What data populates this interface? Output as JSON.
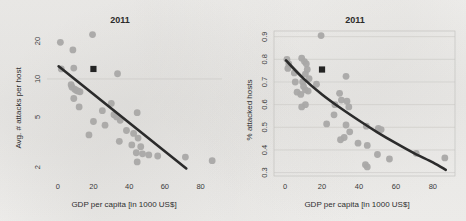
{
  "figure": {
    "panels": [
      {
        "id": "left",
        "title": "2011",
        "xlabel": "GDP per capita [in 1000 US$]",
        "ylabel": "Avg. # attacks per host"
      },
      {
        "id": "right",
        "title": "2011",
        "xlabel": "GDP per capita [in 1000 US$]",
        "ylabel": "% attacked hosts"
      }
    ]
  },
  "chart_data": [
    {
      "type": "scatter",
      "panel": "left",
      "title": "2011",
      "xlabel": "GDP per capita [in 1000 US$]",
      "ylabel": "Avg. # attacks per host",
      "xlim": [
        -6,
        92
      ],
      "ylim": [
        1.7,
        24
      ],
      "yscale": "log",
      "xscale": "linear",
      "xticks": [
        0,
        20,
        40,
        60,
        80
      ],
      "xticklabels": [
        "0",
        "20",
        "40",
        "60",
        "80"
      ],
      "yticks": [
        2,
        5,
        10,
        20
      ],
      "yticklabels": [
        "2",
        "5",
        "10",
        "20"
      ],
      "grid": "single horizontal gridline at y=10",
      "gridlines_y": [
        10
      ],
      "frame": false,
      "legend": "none",
      "series": [
        {
          "name": "countries",
          "marker": "circle",
          "color": "#a9a8a6",
          "points": [
            [
              1.5,
              19.5
            ],
            [
              19.5,
              22.5
            ],
            [
              8.5,
              17.0
            ],
            [
              2.0,
              12.0
            ],
            [
              9.0,
              12.2
            ],
            [
              33.5,
              11.0
            ],
            [
              7.5,
              9.0
            ],
            [
              8.0,
              8.6
            ],
            [
              9.5,
              8.3
            ],
            [
              10.5,
              8.1
            ],
            [
              11.5,
              8.0
            ],
            [
              12.5,
              7.9
            ],
            [
              9.0,
              7.0
            ],
            [
              12.0,
              6.0
            ],
            [
              30.0,
              6.4
            ],
            [
              25.0,
              5.6
            ],
            [
              31.5,
              5.2
            ],
            [
              44.5,
              5.4
            ],
            [
              33.0,
              5.0
            ],
            [
              35.0,
              4.7
            ],
            [
              20.0,
              4.6
            ],
            [
              26.5,
              4.3
            ],
            [
              17.5,
              3.6
            ],
            [
              38.5,
              3.9
            ],
            [
              42.5,
              3.7
            ],
            [
              45.0,
              3.4
            ],
            [
              34.5,
              3.2
            ],
            [
              41.5,
              3.0
            ],
            [
              46.5,
              2.9
            ],
            [
              44.0,
              2.6
            ],
            [
              47.5,
              2.55
            ],
            [
              51.0,
              2.5
            ],
            [
              56.0,
              2.45
            ],
            [
              44.5,
              2.2
            ],
            [
              71.5,
              2.4
            ],
            [
              86.5,
              2.25
            ]
          ]
        },
        {
          "name": "highlighted country",
          "marker": "filled square",
          "color": "#242424",
          "points": [
            [
              20.0,
              12.0
            ]
          ]
        }
      ],
      "fit": {
        "type": "log-linear trend line",
        "color": "#2b2b2b",
        "endpoints": [
          [
            0.5,
            12.6
          ],
          [
            72.0,
            1.95
          ]
        ]
      }
    },
    {
      "type": "scatter",
      "panel": "right",
      "title": "2011",
      "xlabel": "GDP per capita [in 1000 US$]",
      "ylabel": "% attacked hosts",
      "xlim": [
        -6,
        92
      ],
      "ylim": [
        0.285,
        0.925
      ],
      "yscale": "linear",
      "xscale": "linear",
      "xticks": [
        0,
        20,
        40,
        60,
        80
      ],
      "xticklabels": [
        "0",
        "20",
        "40",
        "60",
        "80"
      ],
      "yticks": [
        0.3,
        0.4,
        0.5,
        0.6,
        0.7,
        0.8,
        0.9
      ],
      "yticklabels": [
        "0.3",
        "0.4",
        "0.5",
        "0.6",
        "0.7",
        "0.8",
        "0.9"
      ],
      "grid": "horizontal gridlines at every y tick",
      "gridlines_y": [
        0.3,
        0.4,
        0.5,
        0.6,
        0.7,
        0.8,
        0.9
      ],
      "frame": true,
      "legend": "none",
      "series": [
        {
          "name": "countries",
          "marker": "circle",
          "color": "#a9a8a6",
          "points": [
            [
              19.5,
              0.905
            ],
            [
              1.0,
              0.8
            ],
            [
              9.0,
              0.805
            ],
            [
              2.0,
              0.78
            ],
            [
              10.5,
              0.79
            ],
            [
              11.5,
              0.78
            ],
            [
              1.5,
              0.76
            ],
            [
              12.0,
              0.755
            ],
            [
              5.0,
              0.74
            ],
            [
              11.0,
              0.735
            ],
            [
              33.0,
              0.725
            ],
            [
              13.0,
              0.715
            ],
            [
              5.5,
              0.7
            ],
            [
              9.5,
              0.7
            ],
            [
              17.0,
              0.69
            ],
            [
              10.0,
              0.68
            ],
            [
              11.0,
              0.665
            ],
            [
              12.5,
              0.66
            ],
            [
              6.5,
              0.655
            ],
            [
              29.5,
              0.65
            ],
            [
              8.5,
              0.645
            ],
            [
              30.5,
              0.62
            ],
            [
              33.5,
              0.615
            ],
            [
              11.0,
              0.6
            ],
            [
              27.0,
              0.6
            ],
            [
              9.0,
              0.59
            ],
            [
              34.5,
              0.59
            ],
            [
              26.5,
              0.555
            ],
            [
              22.5,
              0.515
            ],
            [
              33.0,
              0.51
            ],
            [
              44.0,
              0.505
            ],
            [
              50.5,
              0.495
            ],
            [
              52.0,
              0.49
            ],
            [
              35.0,
              0.48
            ],
            [
              32.0,
              0.455
            ],
            [
              30.0,
              0.445
            ],
            [
              39.5,
              0.43
            ],
            [
              44.5,
              0.42
            ],
            [
              50.0,
              0.38
            ],
            [
              71.0,
              0.385
            ],
            [
              56.5,
              0.36
            ],
            [
              86.5,
              0.365
            ],
            [
              43.5,
              0.335
            ],
            [
              44.5,
              0.325
            ]
          ]
        },
        {
          "name": "highlighted country",
          "marker": "filled square",
          "color": "#242424",
          "points": [
            [
              20.0,
              0.755
            ]
          ]
        }
      ],
      "fit": {
        "type": "decaying curve",
        "color": "#2b2b2b",
        "points": [
          [
            0.5,
            0.795
          ],
          [
            10,
            0.715
          ],
          [
            20,
            0.645
          ],
          [
            30,
            0.585
          ],
          [
            40,
            0.53
          ],
          [
            50,
            0.478
          ],
          [
            60,
            0.43
          ],
          [
            70,
            0.385
          ],
          [
            80,
            0.345
          ],
          [
            87,
            0.312
          ]
        ]
      }
    }
  ]
}
